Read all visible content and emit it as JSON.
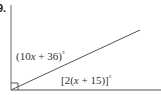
{
  "problem": {
    "number": "9."
  },
  "diagram": {
    "angle_upper": {
      "prefix": "(10",
      "var": "x",
      "suffix": " + 36)",
      "degree": "°"
    },
    "angle_lower": {
      "prefix": "[2(",
      "var": "x",
      "suffix": " + 15)]",
      "degree": "°"
    },
    "right_angle_marker": true,
    "colors": {
      "line": "#555555",
      "text": "#333333"
    }
  }
}
